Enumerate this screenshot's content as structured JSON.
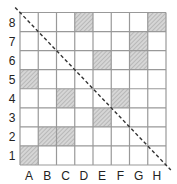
{
  "board": {
    "columns": [
      "A",
      "B",
      "C",
      "D",
      "E",
      "F",
      "G",
      "H"
    ],
    "rows": [
      "1",
      "2",
      "3",
      "4",
      "5",
      "6",
      "7",
      "8"
    ],
    "shaded_cells": [
      "D8",
      "H8",
      "G7",
      "E6",
      "G6",
      "A5",
      "C4",
      "F4",
      "E3",
      "B2",
      "C2",
      "A1"
    ],
    "diagonal": {
      "from": "A8-top-left",
      "to": "H1-bottom-right",
      "style": "dashed"
    },
    "colors": {
      "grid_line": "#999999",
      "shade_fill": "#d6d6d6",
      "hatch": "#9a9a9a",
      "diagonal": "#333333",
      "label": "#222222"
    }
  }
}
